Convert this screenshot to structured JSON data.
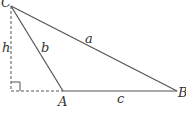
{
  "diagram": {
    "type": "triangle with altitude",
    "vertices": {
      "C": {
        "label": "C",
        "x": 11,
        "y": 6
      },
      "A": {
        "label": "A",
        "x": 63,
        "y": 91
      },
      "B": {
        "label": "B",
        "x": 177,
        "y": 91
      },
      "foot": {
        "x": 11,
        "y": 91
      }
    },
    "sides": {
      "a": {
        "label": "a"
      },
      "b": {
        "label": "b"
      },
      "c": {
        "label": "c"
      }
    },
    "height": {
      "label": "h"
    },
    "colors": {
      "line": "#555555",
      "dashed": "#555555",
      "text": "#333333"
    }
  }
}
